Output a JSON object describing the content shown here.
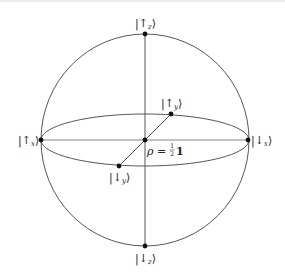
{
  "diagram": {
    "type": "bloch-sphere",
    "colors": {
      "stroke": "#444444",
      "point": "#111111",
      "text": "#222222",
      "background": "#ffffff"
    },
    "labels": {
      "up_z": {
        "ket_open": "|",
        "arrow": "↑",
        "sub": "z",
        "ket_close": "⟩"
      },
      "down_z": {
        "ket_open": "|",
        "arrow": "↓",
        "sub": "z",
        "ket_close": "⟩"
      },
      "up_x": {
        "ket_open": "|",
        "arrow": "↑",
        "sub": "x",
        "ket_close": "⟩"
      },
      "down_x": {
        "ket_open": "|",
        "arrow": "↓",
        "sub": "x",
        "ket_close": "⟩"
      },
      "up_y": {
        "ket_open": "|",
        "arrow": "↑",
        "sub": "y",
        "ket_close": "⟩"
      },
      "down_y": {
        "ket_open": "|",
        "arrow": "↓",
        "sub": "y",
        "ket_close": "⟩"
      },
      "center": {
        "rho": "ρ",
        "equals": " = ",
        "frac_num": "1",
        "frac_den": "2",
        "identity": "1"
      }
    }
  }
}
